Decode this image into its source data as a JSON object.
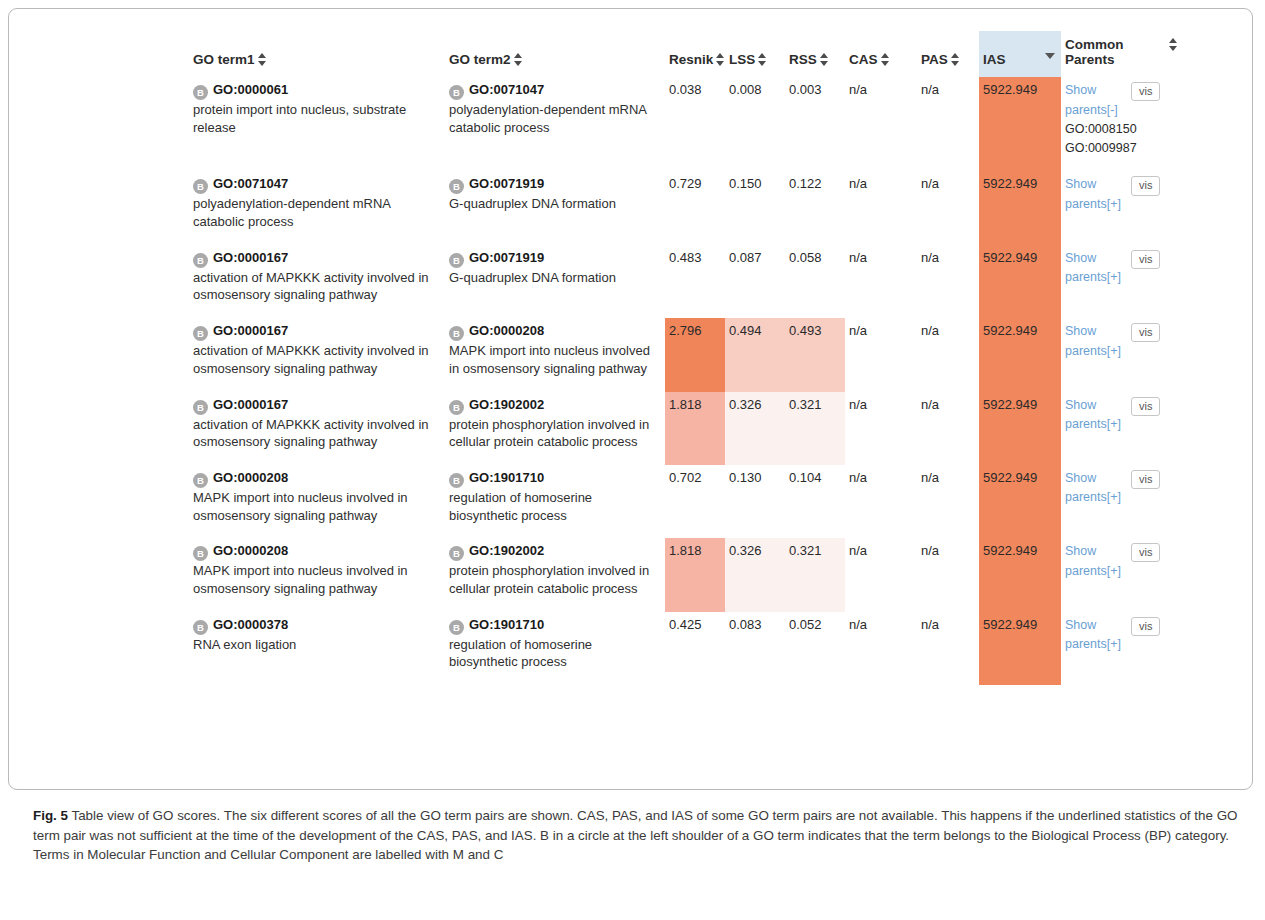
{
  "figure": {
    "label": "Fig. 5",
    "caption": " Table view of GO scores. The six different scores of all the GO term pairs are shown. CAS, PAS, and IAS of some GO term pairs are not available. This happens if the underlined statistics of the GO term pair was not sufficient at the time of the development of the CAS, PAS, and IAS. B in a circle at the left shoulder of a GO term indicates that the term belongs to the Biological Process (BP) category. Terms in Molecular Function and Cellular Component are labelled with M and C"
  },
  "table": {
    "headers": {
      "term1": "GO term1",
      "term2": "GO term2",
      "resnik": "Resnik",
      "lss": "LSS",
      "rss": "RSS",
      "cas": "CAS",
      "pas": "PAS",
      "ias": "IAS",
      "common_parents": "Common Parents"
    },
    "sorted_column": "IAS",
    "sort_direction": "descending",
    "vis_button_label": "vis",
    "show_parents_collapsed": "Show parents[+]",
    "show_parents_expanded": "Show parents[-]",
    "colors": {
      "sorted_header_bg": "#d8e6f2",
      "ias_cell_bg": "#f1875c",
      "high_score_bg": "#f1855a",
      "mid_score_bg": "#f6b4a5",
      "light_score_bg": "#f8cdc2",
      "faint_score_bg": "#fbf1ef",
      "link_color": "#6a9fd4",
      "badge_bg": "#a9a9a9"
    },
    "rows": [
      {
        "term1": {
          "category": "B",
          "id": "GO:0000061",
          "name": "protein import into nucleus, substrate release"
        },
        "term2": {
          "category": "B",
          "id": "GO:0071047",
          "name": "polyadenylation-dependent mRNA catabolic process"
        },
        "resnik": "0.038",
        "lss": "0.008",
        "rss": "0.003",
        "cas": "n/a",
        "pas": "n/a",
        "ias": "5922.949",
        "resnik_shade": "sh-none",
        "lss_shade": "sh-none",
        "rss_shade": "sh-none",
        "parents_label": "Show parents[-]",
        "parents": [
          "GO:0008150",
          "GO:0009987"
        ]
      },
      {
        "term1": {
          "category": "B",
          "id": "GO:0071047",
          "name": "polyadenylation-dependent mRNA catabolic process"
        },
        "term2": {
          "category": "B",
          "id": "GO:0071919",
          "name": "G-quadruplex DNA formation"
        },
        "resnik": "0.729",
        "lss": "0.150",
        "rss": "0.122",
        "cas": "n/a",
        "pas": "n/a",
        "ias": "5922.949",
        "resnik_shade": "sh-none",
        "lss_shade": "sh-none",
        "rss_shade": "sh-none",
        "parents_label": "Show parents[+]",
        "parents": []
      },
      {
        "term1": {
          "category": "B",
          "id": "GO:0000167",
          "name": "activation of MAPKKK activity involved in osmosensory signaling pathway"
        },
        "term2": {
          "category": "B",
          "id": "GO:0071919",
          "name": "G-quadruplex DNA formation"
        },
        "resnik": "0.483",
        "lss": "0.087",
        "rss": "0.058",
        "cas": "n/a",
        "pas": "n/a",
        "ias": "5922.949",
        "resnik_shade": "sh-none",
        "lss_shade": "sh-none",
        "rss_shade": "sh-none",
        "parents_label": "Show parents[+]",
        "parents": []
      },
      {
        "term1": {
          "category": "B",
          "id": "GO:0000167",
          "name": "activation of MAPKKK activity involved in osmosensory signaling pathway"
        },
        "term2": {
          "category": "B",
          "id": "GO:0000208",
          "name": "MAPK import into nucleus involved in osmosensory signaling pathway"
        },
        "resnik": "2.796",
        "lss": "0.494",
        "rss": "0.493",
        "cas": "n/a",
        "pas": "n/a",
        "ias": "5922.949",
        "resnik_shade": "sh-dark",
        "lss_shade": "sh-light",
        "rss_shade": "sh-light",
        "parents_label": "Show parents[+]",
        "parents": []
      },
      {
        "term1": {
          "category": "B",
          "id": "GO:0000167",
          "name": "activation of MAPKKK activity involved in osmosensory signaling pathway"
        },
        "term2": {
          "category": "B",
          "id": "GO:1902002",
          "name": "protein phosphorylation involved in cellular protein catabolic process"
        },
        "resnik": "1.818",
        "lss": "0.326",
        "rss": "0.321",
        "cas": "n/a",
        "pas": "n/a",
        "ias": "5922.949",
        "resnik_shade": "sh-mid",
        "lss_shade": "sh-faint",
        "rss_shade": "sh-faint",
        "parents_label": "Show parents[+]",
        "parents": []
      },
      {
        "term1": {
          "category": "B",
          "id": "GO:0000208",
          "name": "MAPK import into nucleus involved in osmosensory signaling pathway"
        },
        "term2": {
          "category": "B",
          "id": "GO:1901710",
          "name": "regulation of homoserine biosynthetic process"
        },
        "resnik": "0.702",
        "lss": "0.130",
        "rss": "0.104",
        "cas": "n/a",
        "pas": "n/a",
        "ias": "5922.949",
        "resnik_shade": "sh-none",
        "lss_shade": "sh-none",
        "rss_shade": "sh-none",
        "parents_label": "Show parents[+]",
        "parents": []
      },
      {
        "term1": {
          "category": "B",
          "id": "GO:0000208",
          "name": "MAPK import into nucleus involved in osmosensory signaling pathway"
        },
        "term2": {
          "category": "B",
          "id": "GO:1902002",
          "name": "protein phosphorylation involved in cellular protein catabolic process"
        },
        "resnik": "1.818",
        "lss": "0.326",
        "rss": "0.321",
        "cas": "n/a",
        "pas": "n/a",
        "ias": "5922.949",
        "resnik_shade": "sh-mid",
        "lss_shade": "sh-faint",
        "rss_shade": "sh-faint",
        "parents_label": "Show parents[+]",
        "parents": []
      },
      {
        "term1": {
          "category": "B",
          "id": "GO:0000378",
          "name": "RNA exon ligation"
        },
        "term2": {
          "category": "B",
          "id": "GO:1901710",
          "name": "regulation of homoserine biosynthetic process"
        },
        "resnik": "0.425",
        "lss": "0.083",
        "rss": "0.052",
        "cas": "n/a",
        "pas": "n/a",
        "ias": "5922.949",
        "resnik_shade": "sh-none",
        "lss_shade": "sh-none",
        "rss_shade": "sh-none",
        "parents_label": "Show parents[+]",
        "parents": []
      }
    ]
  }
}
